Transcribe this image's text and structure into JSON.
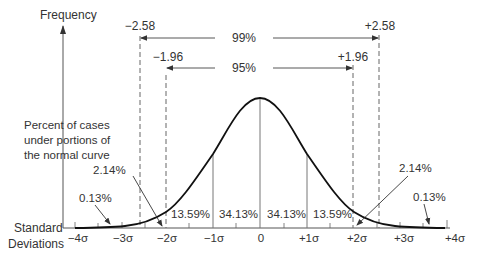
{
  "diagram": {
    "y_axis_label": "Frequency",
    "description_label": [
      "Percent of cases",
      "under portions of",
      "the normal curve"
    ],
    "x_axis_label": [
      "Standard",
      "Deviations"
    ],
    "sigma_ticks": [
      "−4σ",
      "−3σ",
      "−2σ",
      "−1σ",
      "0",
      "+1σ",
      "+2σ",
      "+3σ",
      "+4σ"
    ],
    "intervals": {
      "ci99": {
        "label": "99%",
        "left": "−2.58",
        "right": "+2.58"
      },
      "ci95": {
        "label": "95%",
        "left": "−1.96",
        "right": "+1.96"
      }
    },
    "region_percents": {
      "left_tail": "0.13%",
      "left_2_3": "2.14%",
      "left_1_2": "13.59%",
      "left_0_1": "34.13%",
      "right_0_1": "34.13%",
      "right_1_2": "13.59%",
      "right_2_3": "2.14%",
      "right_tail": "0.13%"
    },
    "colors": {
      "curve": "#111111",
      "axis": "#555555",
      "text": "#333333",
      "dashed": "#666666"
    }
  }
}
